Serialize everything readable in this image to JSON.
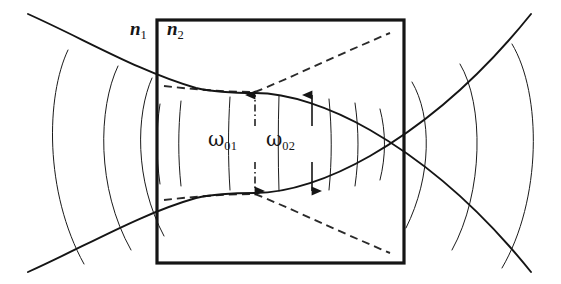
{
  "figure": {
    "type": "optics-ray-diagram",
    "background_color": "#ffffff",
    "ink_color": "#151515"
  },
  "labels": {
    "index_outside": {
      "base": "n",
      "sub": "1",
      "text": "n1"
    },
    "index_inside": {
      "base": "n",
      "sub": "2",
      "text": "n2"
    },
    "waist_outside": {
      "base": "ω",
      "sub": "01",
      "text": "ω01"
    },
    "waist_inside": {
      "base": "ω",
      "sub": "02",
      "text": "ω02"
    }
  },
  "geometry": {
    "canvas": {
      "width": 561,
      "height": 284
    },
    "slab_box": {
      "x1": 157,
      "y1": 20,
      "x2": 404,
      "y2": 263,
      "stroke_width": 3.2
    },
    "axis_y": 143,
    "waist_x": 255,
    "waist_upper_y": 93,
    "waist_lower_y": 193,
    "beam_stroke_width": 1.9,
    "dashed_stroke_width": 1.9,
    "phasefront_stroke_width": 1.0
  },
  "arrows": {
    "omega01": {
      "x": 255,
      "top_y": 95,
      "bottom_y": 191,
      "style": "dash-dot",
      "dash_pattern": "7,3,1.5,3",
      "double_headed": true,
      "head_width": 9,
      "head_length": 11
    },
    "omega02": {
      "x": 312,
      "top_y": 95,
      "bottom_y": 191,
      "style": "solid",
      "dash_pattern": "none",
      "double_headed": true,
      "head_width": 9,
      "head_length": 11
    }
  },
  "beam_envelope": {
    "description": "Solid hyperbolic Gaussian envelope converging to a waist inside the slab then diverging",
    "upper": "M 28,14 C 86,40 140,72 196,88 C 218,93 238,93 255,93 C 288,93 330,107 370,130 C 410,153 470,196 531,272",
    "lower": "M 28,272 C 86,246 140,214 196,198 C 218,193 238,193 255,193 C 288,193 330,179 370,156 C 410,133 470,90 531,14"
  },
  "dashed_divergence": {
    "description": "Dashed lines showing the wider divergence angle of the beam outside the slab index",
    "upper_left": "M 164,86 C 190,89 226,92 255,92",
    "upper_right": "M 255,92 C 290,78 340,54 390,33",
    "lower_left": "M 164,200 C 190,197 226,194 255,194",
    "lower_right": "M 255,194 C 290,208 340,232 390,253",
    "dash_pattern": "8,5"
  },
  "phase_fronts": {
    "outer_left": [
      "M 68,50 C 46,96 44,192 84,264",
      "M 118,66 C 98,108 96,188 131,250",
      "M 152,78 C 136,114 134,180 164,236"
    ],
    "outer_right": [
      "M 412,82 C 432,116 432,176 406,228",
      "M 460,64 C 484,104 484,192 452,250",
      "M 512,44 C 542,94 542,200 502,268"
    ],
    "inner": [
      "M 160,104 C 156,130 156,156 160,184",
      "M 181,101 C 178,130 178,158 181,186",
      "M 230,97 C 228,128 228,160 230,190",
      "M 279,96 C 278,128 278,160 279,191",
      "M 329,99 C 332,130 332,160 329,190",
      "M 355,103 C 359,130 359,158 355,186",
      "M 380,109 C 386,132 386,156 380,180"
    ]
  }
}
